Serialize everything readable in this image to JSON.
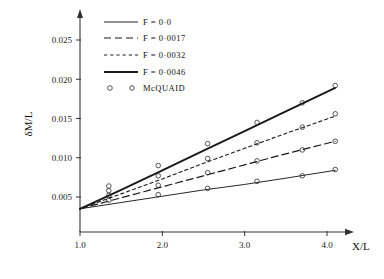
{
  "chart_data": {
    "type": "line",
    "title": "",
    "subtitle": "",
    "xlabel": "X/L",
    "ylabel": "δM/L",
    "xlim": [
      0.85,
      4.35
    ],
    "ylim": [
      0.0,
      0.0275
    ],
    "xticks": [
      1.0,
      2.0,
      3.0,
      4.0
    ],
    "xtick_labels": [
      "1.0",
      "2.0",
      "3.0",
      "4.0"
    ],
    "yticks": [
      0.005,
      0.01,
      0.015,
      0.02,
      0.025
    ],
    "ytick_labels": [
      "0.005",
      "0.010",
      "0.015",
      "0.020",
      "0.025"
    ],
    "grid": false,
    "legend_position": "top-left",
    "axis_style": "arrow-ended-open-axes",
    "series": [
      {
        "name": "F = 0·0",
        "style": "thin-solid",
        "x": [
          1.0,
          1.5,
          2.0,
          2.5,
          3.0,
          3.5,
          4.1
        ],
        "values": [
          0.0035,
          0.0043,
          0.0051,
          0.0059,
          0.0066,
          0.0074,
          0.0084
        ]
      },
      {
        "name": "F = 0·0017",
        "style": "long-dash",
        "x": [
          1.0,
          1.5,
          2.0,
          2.5,
          3.0,
          3.5,
          4.1
        ],
        "values": [
          0.0035,
          0.0049,
          0.0063,
          0.0077,
          0.0091,
          0.0105,
          0.0121
        ]
      },
      {
        "name": "F = 0·0032",
        "style": "short-dash",
        "x": [
          1.0,
          1.5,
          2.0,
          2.5,
          3.0,
          3.5,
          4.1
        ],
        "values": [
          0.0035,
          0.0054,
          0.0073,
          0.0093,
          0.0112,
          0.0131,
          0.0153
        ]
      },
      {
        "name": "F = 0·0046",
        "style": "thick-solid",
        "x": [
          1.0,
          1.5,
          2.0,
          2.5,
          3.0,
          3.5,
          4.1
        ],
        "values": [
          0.0035,
          0.0059,
          0.0084,
          0.0109,
          0.0134,
          0.0159,
          0.0189
        ]
      }
    ],
    "scatter": {
      "name": "McQUAID",
      "marker": "open-circle",
      "points": [
        {
          "x": 1.35,
          "y": 0.0046
        },
        {
          "x": 1.95,
          "y": 0.0053
        },
        {
          "x": 2.55,
          "y": 0.0061
        },
        {
          "x": 3.15,
          "y": 0.007
        },
        {
          "x": 3.7,
          "y": 0.0077
        },
        {
          "x": 4.1,
          "y": 0.0085
        },
        {
          "x": 1.35,
          "y": 0.0052
        },
        {
          "x": 1.95,
          "y": 0.0065
        },
        {
          "x": 2.55,
          "y": 0.0081
        },
        {
          "x": 3.15,
          "y": 0.0096
        },
        {
          "x": 3.7,
          "y": 0.011
        },
        {
          "x": 4.1,
          "y": 0.0121
        },
        {
          "x": 1.35,
          "y": 0.0058
        },
        {
          "x": 1.95,
          "y": 0.0077
        },
        {
          "x": 2.55,
          "y": 0.0099
        },
        {
          "x": 3.15,
          "y": 0.0119
        },
        {
          "x": 3.7,
          "y": 0.0139
        },
        {
          "x": 4.1,
          "y": 0.0156
        },
        {
          "x": 1.35,
          "y": 0.0064
        },
        {
          "x": 1.95,
          "y": 0.009
        },
        {
          "x": 2.55,
          "y": 0.0118
        },
        {
          "x": 3.15,
          "y": 0.0145
        },
        {
          "x": 3.7,
          "y": 0.017
        },
        {
          "x": 4.1,
          "y": 0.0192
        }
      ]
    },
    "legend": [
      {
        "label": "F = 0·0",
        "style": "thin-solid"
      },
      {
        "label": "F = 0·0017",
        "style": "long-dash"
      },
      {
        "label": "F = 0·0032",
        "style": "short-dash"
      },
      {
        "label": "F = 0·0046",
        "style": "thick-solid"
      },
      {
        "label": "McQUAID",
        "style": "open-circle"
      }
    ]
  }
}
